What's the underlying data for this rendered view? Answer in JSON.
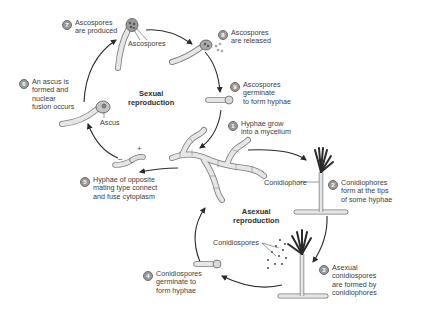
{
  "diagram": {
    "cycles": {
      "sexual": "Sexual\nreproduction",
      "asexual": "Asexual\nreproduction"
    },
    "steps": [
      {
        "num": "1",
        "text": "Hyphae grow\ninto a mycelium"
      },
      {
        "num": "2",
        "text": "Conidiophores\nform at the tips\nof some hyphae"
      },
      {
        "num": "3",
        "text": "Asexual\nconidiospores\nare formed by\nconidiophores"
      },
      {
        "num": "4",
        "text": "Conidiospores\ngerminate to\nform hyphae"
      },
      {
        "num": "5",
        "text": "Hyphae of opposite\nmating type connect\nand fuse cytoplasm"
      },
      {
        "num": "6",
        "text": "An ascus is\nformed and\nnuclear\nfusion occurs"
      },
      {
        "num": "7",
        "text": "Ascospores\nare produced"
      },
      {
        "num": "8",
        "text": "Ascospores\nare released"
      },
      {
        "num": "9",
        "text": "Ascospores\ngerminate\nto form hyphae"
      }
    ],
    "structure_labels": {
      "ascospores": "Ascospores",
      "ascus": "Ascus",
      "conidiophore": "Conidiophore",
      "conidiospores": "Conidiospores"
    },
    "mating_signs": {
      "minus": "−",
      "plus": "+"
    },
    "colors": {
      "line": "#2a2a2a",
      "hypha_fill": "#e4e4e4",
      "hypha_stroke": "#7a7a7a",
      "spore_fill": "#b8b8b8",
      "step_badge": "#9a9a9a"
    }
  }
}
